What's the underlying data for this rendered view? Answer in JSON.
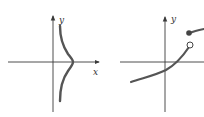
{
  "colors": {
    "axis": "#3a3a3a",
    "curve": "#555555",
    "background": "#ffffff"
  },
  "graphs": [
    {
      "name": "left-graph",
      "y_label": "y",
      "x_label": "x",
      "description": "Curve bulging right, crossing x-axis at positive x, not a function of x"
    },
    {
      "name": "right-graph",
      "y_label": "y",
      "description": "Increasing curve with jump discontinuity: open circle at end of lower branch, filled dot at start of upper branch"
    }
  ]
}
